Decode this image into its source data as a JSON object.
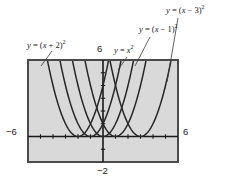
{
  "figure": {
    "kind": "graphing-calculator-window",
    "background": "#ffffff",
    "plot_background": "#d9d9d9",
    "frame_color": "#4a4a4a",
    "curve_color": "#262626",
    "axis_color": "#1a1a1a"
  },
  "axis_numbers": {
    "top": "6",
    "left": "−6",
    "right": "6",
    "bottom": "−2"
  },
  "labels": [
    {
      "id": "xp2",
      "text": "y = (x + 2)²",
      "lhs": "y",
      "eq": " = (",
      "var": "x",
      "tail": " + 2)",
      "exp": "2"
    },
    {
      "id": "x2",
      "text": "y = x²",
      "lhs": "y",
      "eq": " = ",
      "var": "x",
      "tail": "",
      "exp": "2"
    },
    {
      "id": "xm1",
      "text": "y = (x − 1)²",
      "lhs": "y",
      "eq": " = (",
      "var": "x",
      "tail": " − 1)",
      "exp": "2"
    },
    {
      "id": "xm3",
      "text": "y = (x − 3)²",
      "lhs": "y",
      "eq": " = (",
      "var": "x",
      "tail": " − 3)",
      "exp": "2"
    }
  ],
  "chart_data": {
    "type": "line",
    "title": "",
    "xlabel": "",
    "ylabel": "",
    "xlim": [
      -6,
      6
    ],
    "ylim": [
      -2,
      6
    ],
    "grid": false,
    "legend": "annotations-with-leader-lines",
    "x_ticks": [
      -5,
      -4,
      -3,
      -2,
      -1,
      0,
      1,
      2,
      3,
      4,
      5
    ],
    "y_ticks": [
      -1,
      1,
      2,
      3,
      4,
      5
    ],
    "series": [
      {
        "name": "y = (x + 2)²",
        "equation": "y=(x+2)^2",
        "vertex": [
          -2,
          0
        ],
        "a": 1,
        "h": -2,
        "k": 0
      },
      {
        "name": "y = (x + 1)²",
        "equation": "y=(x+1)^2",
        "vertex": [
          -1,
          0
        ],
        "a": 1,
        "h": -1,
        "k": 0
      },
      {
        "name": "y = x²",
        "equation": "y=x^2",
        "vertex": [
          0,
          0
        ],
        "a": 1,
        "h": 0,
        "k": 0
      },
      {
        "name": "y = (x − 1)²",
        "equation": "y=(x-1)^2",
        "vertex": [
          1,
          0
        ],
        "a": 1,
        "h": 1,
        "k": 0
      },
      {
        "name": "y = (x − 3)²",
        "equation": "y=(x-3)^2",
        "vertex": [
          3,
          0
        ],
        "a": 1,
        "h": 3,
        "k": 0
      }
    ],
    "annotations": [
      {
        "text": "y = (x + 2)²",
        "points_to_vertex_of": "y=(x+2)^2"
      },
      {
        "text": "y = x²",
        "points_to_vertex_of": "y=x^2"
      },
      {
        "text": "y = (x − 1)²",
        "points_to_vertex_of": "y=(x-1)^2"
      },
      {
        "text": "y = (x − 3)²",
        "points_to_vertex_of": "y=(x-3)^2"
      }
    ]
  }
}
